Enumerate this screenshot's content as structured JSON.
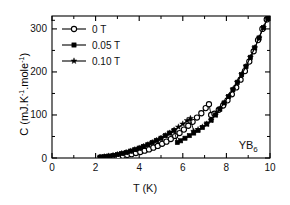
{
  "chart_data": {
    "type": "line",
    "title": "",
    "xlabel": "T (K)",
    "ylabel": "C (mJ.K-1.mole-1)",
    "ylabel_parts": {
      "pre": "C (mJ.K",
      "sup1": "-1",
      "mid": ".mole",
      "sup2": "-1",
      "post": ")"
    },
    "xlim": [
      0,
      10
    ],
    "ylim": [
      0,
      330
    ],
    "xticks": [
      0,
      2,
      4,
      6,
      8,
      10
    ],
    "xticklabels": [
      "0",
      "2",
      "4",
      "6",
      "8",
      "10"
    ],
    "yticks": [
      0,
      100,
      200,
      300
    ],
    "yticklabels": [
      "0",
      "100",
      "200",
      "300"
    ],
    "grid": false,
    "legend_position": "upper left",
    "annotation": {
      "text": "YB6",
      "base": "YB",
      "sub": "6",
      "x": 9.0,
      "y": 22
    },
    "series": [
      {
        "name": "0 T",
        "marker": "open-circle",
        "color": "#000000",
        "x": [
          2.25,
          2.45,
          2.65,
          2.85,
          3.05,
          3.25,
          3.45,
          3.65,
          3.85,
          4.05,
          4.25,
          4.45,
          4.65,
          4.85,
          5.05,
          5.25,
          5.45,
          5.65,
          5.85,
          6.05,
          6.25,
          6.45,
          6.65,
          6.85,
          7.05,
          7.2,
          7.3,
          7.45,
          7.65,
          7.85,
          8.05,
          8.25,
          8.45,
          8.65,
          8.85,
          9.05,
          9.25,
          9.45,
          9.65,
          9.85,
          9.98
        ],
        "y": [
          1,
          1.5,
          2,
          3,
          4,
          5.5,
          7,
          9,
          11.5,
          14,
          17,
          20,
          24,
          28,
          33,
          38,
          44,
          51,
          58,
          66,
          75,
          84,
          94,
          104,
          116,
          125,
          100,
          103,
          112,
          122,
          134,
          148,
          164,
          182,
          202,
          224,
          248,
          274,
          300,
          322,
          331
        ]
      },
      {
        "name": "0.05 T",
        "marker": "filled-square",
        "color": "#000000",
        "x": [
          2.2,
          2.4,
          2.6,
          2.8,
          3.0,
          3.2,
          3.4,
          3.6,
          3.8,
          4.0,
          4.2,
          4.4,
          4.6,
          4.8,
          5.0,
          5.2,
          5.4,
          5.6,
          5.75,
          5.9,
          6.1,
          6.3,
          6.5,
          6.7,
          6.9,
          7.1,
          7.3,
          7.5,
          7.7,
          7.9,
          8.1,
          8.3,
          8.5,
          8.7,
          8.9,
          9.1,
          9.3,
          9.5,
          9.7,
          9.9,
          9.98
        ],
        "y": [
          2,
          3,
          4.5,
          6,
          8,
          10.5,
          13,
          16,
          19.5,
          23,
          27,
          31,
          36,
          41,
          46,
          52,
          58,
          64,
          36,
          40,
          46,
          52,
          58,
          64,
          71,
          79,
          88,
          100,
          114,
          128,
          143,
          159,
          176,
          194,
          213,
          234,
          256,
          279,
          303,
          324,
          331
        ]
      },
      {
        "name": "0.10 T",
        "marker": "filled-star",
        "color": "#000000",
        "x": [
          2.2,
          2.4,
          2.6,
          2.8,
          3.0,
          3.2,
          3.4,
          3.6,
          3.8,
          4.0,
          4.2,
          4.4,
          4.6,
          4.8,
          5.0,
          5.2,
          5.4,
          5.6,
          5.8,
          6.0,
          6.2,
          6.35,
          6.5,
          6.7,
          6.9,
          7.1,
          7.3,
          7.5,
          7.7,
          7.9,
          8.1,
          8.3,
          8.5,
          8.7,
          8.9,
          9.1,
          9.3,
          9.5,
          9.7,
          9.9,
          9.98
        ],
        "y": [
          2,
          3,
          4.5,
          6,
          8,
          10.5,
          13,
          16,
          19.5,
          23,
          27,
          31,
          36,
          41,
          46,
          52,
          58,
          65,
          72,
          79,
          87,
          92,
          62,
          66,
          72,
          79,
          88,
          100,
          114,
          128,
          143,
          159,
          176,
          194,
          213,
          234,
          256,
          279,
          303,
          324,
          331
        ]
      }
    ]
  },
  "legend": {
    "entries": [
      {
        "label": "0 T",
        "marker": "open-circle"
      },
      {
        "label": "0.05 T",
        "marker": "filled-square"
      },
      {
        "label": "0.10 T",
        "marker": "filled-star"
      }
    ]
  }
}
